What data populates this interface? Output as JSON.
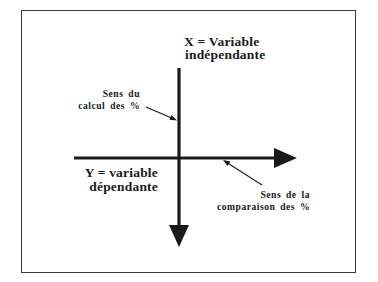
{
  "diagram": {
    "x_axis_label": {
      "line1": "X = Variable",
      "line2": "indépendante"
    },
    "calc_direction_label": {
      "line1": "Sens du",
      "line2": "calcul des %"
    },
    "y_axis_label": {
      "line1": "Y = variable",
      "line2": "dépendante"
    },
    "comparison_direction_label": {
      "line1": "Sens de la",
      "line2": "comparaison des %"
    },
    "colors": {
      "axis": "#1a1a1a",
      "frame": "#3a3a3a",
      "text": "#1a1a1a",
      "background": "#ffffff"
    }
  }
}
